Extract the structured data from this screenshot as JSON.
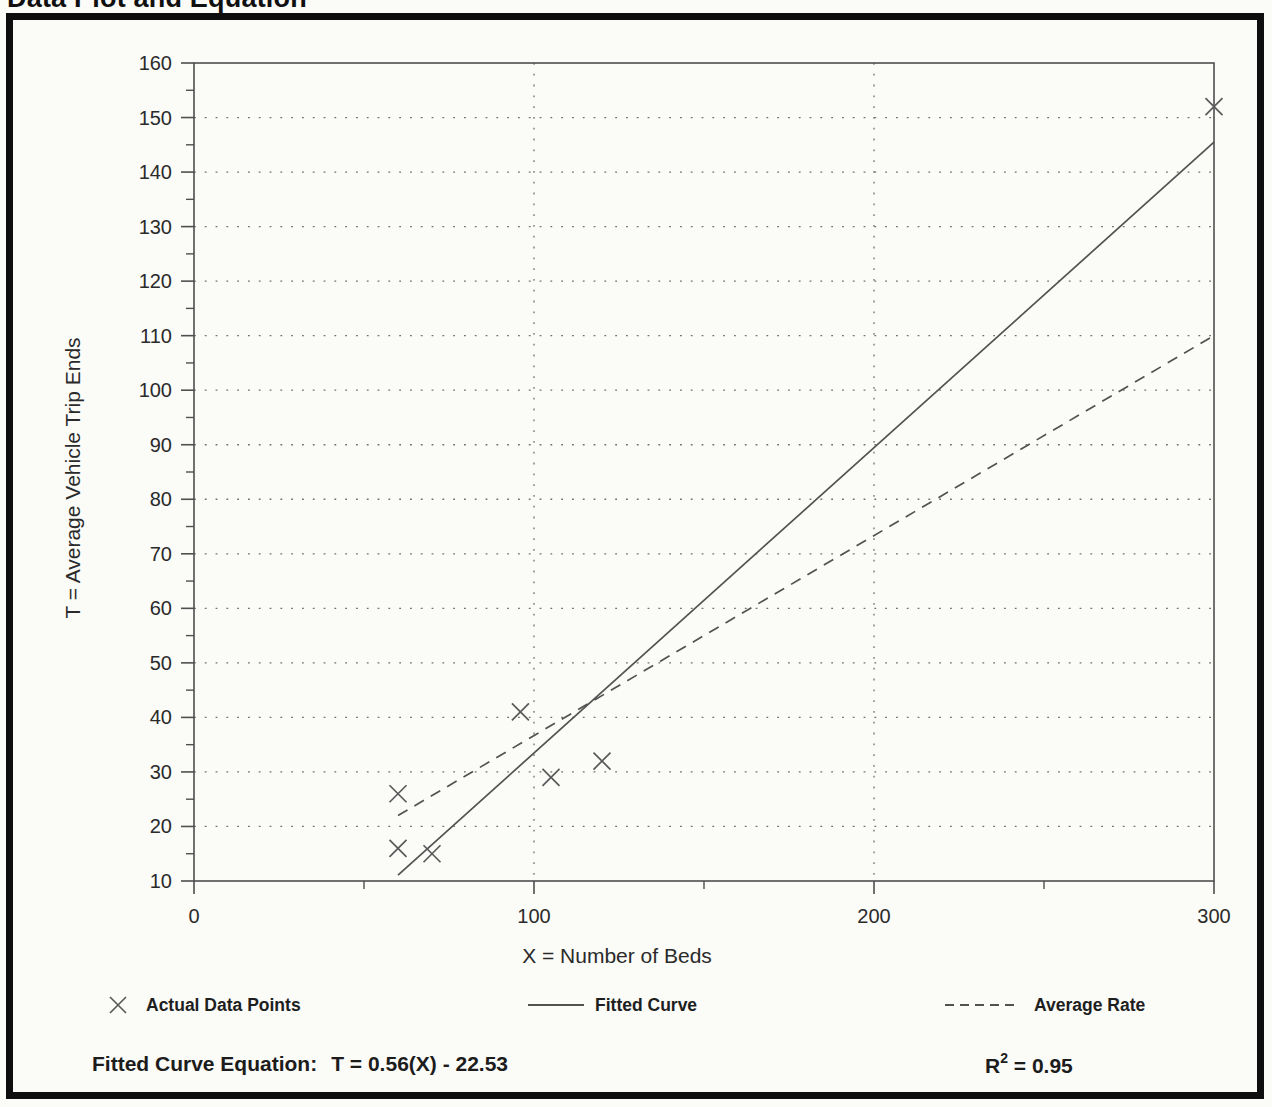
{
  "page": {
    "title": "Data Plot and Equation"
  },
  "chart_data": {
    "type": "scatter",
    "title": "Data Plot and Equation",
    "xlabel": "X = Number of Beds",
    "ylabel": "T = Average Vehicle Trip Ends",
    "xlim": [
      0,
      300
    ],
    "ylim": [
      10,
      160
    ],
    "x_major_ticks": [
      0,
      100,
      200,
      300
    ],
    "x_minor_ticks": [
      50,
      150,
      250
    ],
    "y_major_tick_step": 10,
    "y_minor_tick_step": 5,
    "x_gridlines": [
      100,
      200
    ],
    "grid": "dotted",
    "legend_position": "below",
    "points": [
      [
        60,
        26
      ],
      [
        60,
        16
      ],
      [
        70,
        15
      ],
      [
        96,
        41
      ],
      [
        105,
        29
      ],
      [
        120,
        32
      ],
      [
        300,
        152
      ]
    ],
    "fitted_curve": {
      "slope": 0.56,
      "intercept": -22.53,
      "x_start": 60,
      "x_end": 300,
      "style": "solid"
    },
    "average_rate": {
      "rate": 0.3667,
      "x_start": 60,
      "x_end": 300,
      "style": "dashed"
    },
    "legend": {
      "entries": [
        {
          "label": "Actual Data Points",
          "marker": "x-marker"
        },
        {
          "label": "Fitted Curve",
          "marker": "solid-line"
        },
        {
          "label": "Average Rate",
          "marker": "dashed-line"
        }
      ]
    }
  },
  "footer": {
    "equation_label": "Fitted Curve Equation:",
    "equation_value": "T = 0.56(X) - 22.53",
    "r2_base": "R",
    "r2_sup": "2",
    "r2_value": " = 0.95"
  },
  "colors": {
    "paper": "#fbfbf8",
    "border": "#0e0e0e",
    "ink": "#2a2a2a",
    "axis": "#4f4f4f",
    "grid": "#707070",
    "marker": "#5a5a5a",
    "line": "#525252"
  }
}
